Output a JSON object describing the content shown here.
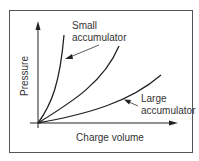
{
  "diagram": {
    "type": "pressure-vs-volume curves",
    "colors": {
      "frame": "#555555",
      "line": "#222222",
      "text": "#333333",
      "background": "#ffffff"
    },
    "axes": {
      "x_label": "Charge volume",
      "y_label": "Pressure"
    },
    "curves": [
      {
        "name": "small-accumulator-curve",
        "label_line1": "Small",
        "label_line2": "accumulator"
      },
      {
        "name": "medium-accumulator-curve"
      },
      {
        "name": "large-accumulator-curve",
        "label_line1": "Large",
        "label_line2": "accumulator"
      }
    ]
  }
}
